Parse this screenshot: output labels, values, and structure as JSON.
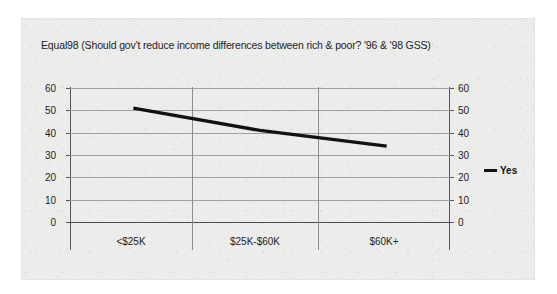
{
  "chart_data": {
    "type": "line",
    "title": "Equal98 (Should gov't reduce income differences between rich & poor? '96 & '98 GSS)",
    "categories": [
      "<$25K",
      "$25K-$60K",
      "$60K+"
    ],
    "series": [
      {
        "name": "Yes",
        "values": [
          51,
          41,
          34
        ],
        "color": "#121212"
      }
    ],
    "xlabel": "",
    "ylabel": "",
    "ylim": [
      0,
      60
    ],
    "yticks": [
      60,
      50,
      40,
      30,
      20,
      10,
      0
    ],
    "y_axis_left_labels": [
      "60",
      "50",
      "40",
      "30",
      "20",
      "10",
      "0"
    ],
    "y_axis_right_labels": [
      "60",
      "50",
      "40",
      "30",
      "20",
      "10",
      "0"
    ],
    "grid": "horizontal-and-category-dividers",
    "legend": {
      "position": "right",
      "entries": [
        {
          "label": "Yes",
          "marker": "line-swatch",
          "color": "#121212"
        }
      ]
    },
    "axes": {
      "dual_y_axis": true,
      "y_tick_step": 10
    }
  },
  "legend": {
    "yes_label": "Yes"
  }
}
